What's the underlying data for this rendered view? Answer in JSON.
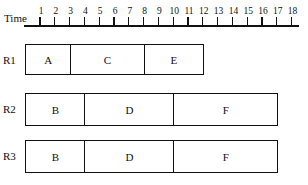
{
  "axis": {
    "label": "Time",
    "ticks": [
      "1",
      "2",
      "3",
      "4",
      "5",
      "6",
      "7",
      "8",
      "9",
      "10",
      "11",
      "12",
      "13",
      "14",
      "15",
      "16",
      "17",
      "18"
    ]
  },
  "rows": [
    {
      "label": "R1",
      "tasks": [
        {
          "name": "A",
          "start": 0,
          "end": 3
        },
        {
          "name": "C",
          "start": 3,
          "end": 8
        },
        {
          "name": "E",
          "start": 8,
          "end": 12
        }
      ]
    },
    {
      "label": "R2",
      "tasks": [
        {
          "name": "B",
          "start": 0,
          "end": 4
        },
        {
          "name": "D",
          "start": 4,
          "end": 10
        },
        {
          "name": "F",
          "start": 10,
          "end": 17
        }
      ]
    },
    {
      "label": "R3",
      "tasks": [
        {
          "name": "B",
          "start": 0,
          "end": 4
        },
        {
          "name": "D",
          "start": 4,
          "end": 10
        },
        {
          "name": "F",
          "start": 10,
          "end": 17
        }
      ]
    }
  ]
}
